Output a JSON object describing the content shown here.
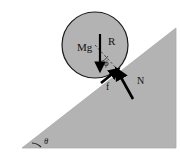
{
  "figure": {
    "background_color": "#ffffff",
    "incline": {
      "name": "inclined-plane",
      "fill_color": "#b3b3b3",
      "edge_color": "#a8a8a8",
      "angle_label": "θ",
      "apex_point": [
        176,
        28
      ],
      "base_left_point": [
        22,
        148
      ],
      "base_right_point": [
        176,
        148
      ]
    },
    "ball": {
      "name": "ball",
      "fill_color": "#b3b3b3",
      "stroke_color": "#1a1a1a",
      "center": [
        95,
        45
      ],
      "radius": 33,
      "radius_label": "R",
      "radius_line_style": "dashed"
    },
    "forces": [
      {
        "name": "weight-vector",
        "label": "Mg",
        "direction": "down",
        "color": "#000000",
        "tail": [
          100,
          34
        ],
        "head": [
          100,
          70
        ]
      },
      {
        "name": "normal-force-vector",
        "label": "N",
        "direction": "up-left (perpendicular to incline)",
        "color": "#000000",
        "tail": [
          133,
          99
        ],
        "head": [
          116,
          69
        ]
      },
      {
        "name": "friction-force-vector",
        "label": "f",
        "direction": "up-right (along incline)",
        "color": "#000000",
        "tail": [
          101,
          83
        ],
        "head": [
          118,
          70
        ]
      }
    ],
    "angles": [
      {
        "name": "phi-angle",
        "label": "ϕ",
        "description": "angle between weight vector and ball radius at contact",
        "position": [
          108,
          63
        ]
      },
      {
        "name": "theta-angle",
        "label": "θ",
        "description": "incline angle at base of the plane",
        "position": [
          48,
          136
        ]
      }
    ],
    "labels": {
      "weight": "Mg",
      "radius": "R",
      "normal": "N",
      "friction": "f",
      "phi": "ϕ",
      "theta": "θ"
    }
  }
}
